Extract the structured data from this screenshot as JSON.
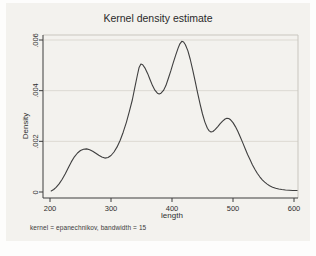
{
  "chart_data": {
    "type": "line",
    "title": "Kernel density estimate",
    "xlabel": "length",
    "ylabel": "Density",
    "note": "kernel = epanechnikov, bandwidth = 15",
    "xlim": [
      200,
      600
    ],
    "ylim": [
      0,
      0.006
    ],
    "x_ticks": [
      200,
      300,
      400,
      500,
      600
    ],
    "y_ticks": [
      0,
      0.002,
      0.004,
      0.006
    ],
    "y_tick_labels": [
      "0",
      ".002",
      ".004",
      ".006"
    ],
    "grid": true,
    "legend": "none",
    "series": [
      {
        "name": "kdensity",
        "x": [
          202,
          206,
          210,
          215,
          220,
          225,
          230,
          235,
          240,
          245,
          250,
          255,
          260,
          265,
          270,
          275,
          280,
          285,
          290,
          295,
          300,
          305,
          310,
          315,
          320,
          325,
          330,
          335,
          339,
          343,
          346,
          349,
          352,
          356,
          360,
          364,
          368,
          372,
          376,
          379,
          382,
          386,
          390,
          394,
          398,
          402,
          406,
          410,
          413,
          416,
          419,
          422,
          426,
          430,
          434,
          438,
          442,
          446,
          450,
          454,
          458,
          461,
          464,
          467,
          471,
          475,
          479,
          483,
          487,
          490,
          493,
          496,
          500,
          504,
          508,
          512,
          516,
          520,
          524,
          528,
          532,
          536,
          540,
          544,
          548,
          552,
          556,
          560,
          565,
          570,
          575,
          580,
          586,
          592,
          598,
          605
        ],
        "y": [
          4e-05,
          0.0001,
          0.00018,
          0.00032,
          0.0005,
          0.00072,
          0.00096,
          0.00119,
          0.00139,
          0.00154,
          0.00164,
          0.00169,
          0.0017,
          0.00167,
          0.00161,
          0.00153,
          0.00145,
          0.00138,
          0.00134,
          0.00136,
          0.00144,
          0.00158,
          0.00178,
          0.00204,
          0.00236,
          0.00274,
          0.00317,
          0.00363,
          0.00412,
          0.00458,
          0.00492,
          0.00505,
          0.00502,
          0.00488,
          0.00468,
          0.00444,
          0.0042,
          0.00402,
          0.0039,
          0.00387,
          0.0039,
          0.00401,
          0.0042,
          0.00448,
          0.00478,
          0.0051,
          0.0054,
          0.00568,
          0.00585,
          0.00595,
          0.00592,
          0.00581,
          0.00557,
          0.00523,
          0.00482,
          0.00437,
          0.00391,
          0.00347,
          0.00308,
          0.00276,
          0.00252,
          0.00241,
          0.00237,
          0.00239,
          0.00247,
          0.00258,
          0.0027,
          0.0028,
          0.00288,
          0.00291,
          0.0029,
          0.00285,
          0.00274,
          0.00258,
          0.00239,
          0.00217,
          0.00194,
          0.00171,
          0.00148,
          0.00127,
          0.00107,
          0.00089,
          0.00073,
          0.0006,
          0.00048,
          0.00039,
          0.00031,
          0.00025,
          0.00019,
          0.00015,
          0.00012,
          0.0001,
          8e-05,
          7e-05,
          6e-05,
          6e-05
        ]
      }
    ]
  },
  "colors": {
    "curve": "#3f3f3f",
    "axis": "#3c3c3c",
    "grid": "#dcd9d2",
    "light_border": "#c9c6bf",
    "figure_bg": "#f3f2ee"
  }
}
